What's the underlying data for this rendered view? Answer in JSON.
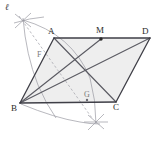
{
  "figure": {
    "width": 164,
    "height": 142,
    "background": "#ffffff",
    "stroke_color": "#4a4a52",
    "arc_color": "#9a9aa2",
    "dash_color": "#a8a8b0",
    "fill_color": "#eeeeee"
  },
  "labels": {
    "line_l": "ℓ",
    "A": "A",
    "B": "B",
    "C": "C",
    "D": "D",
    "M": "M",
    "F": "F",
    "G": "G"
  },
  "points": {
    "A": {
      "x": 54,
      "y": 38
    },
    "B": {
      "x": 20,
      "y": 103
    },
    "C": {
      "x": 116,
      "y": 102
    },
    "D": {
      "x": 150,
      "y": 38
    },
    "M": {
      "x": 101,
      "y": 39
    },
    "F": {
      "x": 49,
      "y": 62
    },
    "G": {
      "x": 87,
      "y": 100
    },
    "X_top": {
      "x": 23,
      "y": 20
    },
    "X_bottom": {
      "x": 96,
      "y": 122
    }
  },
  "label_positions": {
    "line_l": {
      "x": 5,
      "y": 3
    },
    "A": {
      "x": 48,
      "y": 27
    },
    "B": {
      "x": 11,
      "y": 104
    },
    "C": {
      "x": 113,
      "y": 103
    },
    "D": {
      "x": 142,
      "y": 27
    },
    "M": {
      "x": 96,
      "y": 26
    },
    "F": {
      "x": 37,
      "y": 51
    },
    "G": {
      "x": 84,
      "y": 91
    }
  },
  "segments": [
    {
      "name": "side-AD",
      "from": "A",
      "to": "D"
    },
    {
      "name": "side-BC",
      "from": "B",
      "to": "C"
    },
    {
      "name": "side-AB",
      "from": "A",
      "to": "B"
    },
    {
      "name": "side-DC",
      "from": "D",
      "to": "C"
    },
    {
      "name": "cevian-BM",
      "from": "B",
      "to": "M"
    },
    {
      "name": "cevian-BD",
      "from": "B",
      "to": "D"
    },
    {
      "name": "diagonal-AC",
      "from": "A",
      "to": "C"
    }
  ],
  "arcs": [
    {
      "name": "arc-centered-B-large"
    },
    {
      "name": "arc-centered-A-left"
    },
    {
      "name": "arc-lower-small"
    }
  ],
  "construction": {
    "dashed_line_name": "line-l-dashed",
    "tick_marks": [
      "cross-mark-top",
      "cross-mark-bottom"
    ]
  }
}
